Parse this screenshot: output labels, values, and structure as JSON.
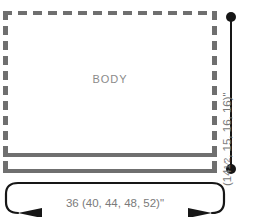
{
  "diagram": {
    "pieces": [
      {
        "name": "BODY",
        "label": "BODY",
        "outline_style": "dashed",
        "outline_color": "#6f6f6f"
      }
    ],
    "hem": {
      "name": "hem-band",
      "style": "solid",
      "color": "#6f6f6f"
    },
    "dimensions": {
      "vertical": {
        "name": "height-dimension",
        "base_value": "14",
        "alt_values": "14½, 15, 16, 16",
        "unit": "\"",
        "whole": "14",
        "open_paren": "(14",
        "fraction_numerator": "1",
        "fraction_denominator": "2",
        "rest": ", 15, 16, 16)\"",
        "full_text": "14 (14½, 15, 16, 16)\"",
        "endpoint_marker": "dot",
        "line_color": "#161616",
        "text_color": "#7a7a7a"
      },
      "horizontal": {
        "name": "width-dimension",
        "base_value": "36",
        "alt_values": "40, 44, 48, 52",
        "unit": "\"",
        "full_text": "36 (40, 44, 48, 52)\"",
        "endpoint_marker": "arrowhead",
        "line_color": "#161616",
        "text_color": "#7a7a7a"
      }
    },
    "colors": {
      "background": "#ffffff",
      "outline": "#6f6f6f",
      "dimension_line": "#161616",
      "dimension_text": "#7a7a7a",
      "piece_label": "#8a8a8a"
    }
  }
}
